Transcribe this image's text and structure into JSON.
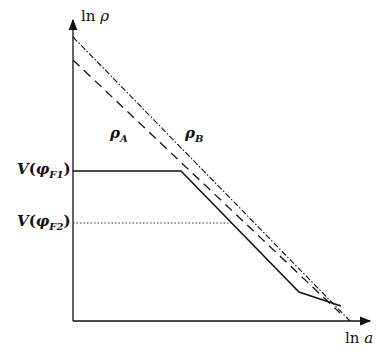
{
  "axes": {
    "y_label_fn": "ln",
    "y_label_var": "ρ",
    "x_label_fn": "ln",
    "x_label_var": "a"
  },
  "curves": {
    "rho_a": {
      "symbol": "ρ",
      "sub": "A",
      "style": "dashed"
    },
    "rho_b": {
      "symbol": "ρ",
      "sub": "B",
      "style": "dash-dot"
    },
    "potential": {
      "style": "solid"
    }
  },
  "levels": {
    "v1": {
      "fn": "V",
      "open": "(",
      "phi": "φ",
      "sub": "F1",
      "close": ")"
    },
    "v2": {
      "fn": "V",
      "open": "(",
      "phi": "φ",
      "sub": "F2",
      "close": ")"
    }
  },
  "colors": {
    "ink": "#111111",
    "background": "#ffffff"
  }
}
